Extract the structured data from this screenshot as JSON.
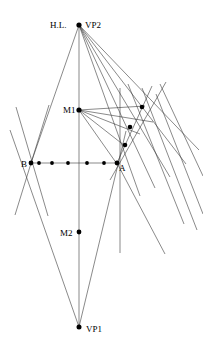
{
  "diagram": {
    "canvas": {
      "width": 203,
      "height": 349,
      "background": "#ffffff"
    },
    "stroke_color": "#3b3b3b",
    "dot_color": "#000000",
    "labels": {
      "horizon": "H.L.",
      "vp2": "VP2",
      "vp1": "VP1",
      "m1": "M1",
      "m2": "M2",
      "point_a": "A",
      "point_b": "B"
    },
    "vertices": [
      {
        "id": "vp2",
        "label": "VP2",
        "x": 79,
        "y": 25,
        "label_x": 84,
        "label_y": 24
      },
      {
        "id": "hl",
        "label": "H.L.",
        "x": 79,
        "y": 25,
        "label_x": 51,
        "label_y": 24
      },
      {
        "id": "m1",
        "label": "M1",
        "x": 79,
        "y": 110,
        "label_x": 62,
        "label_y": 113
      },
      {
        "id": "b",
        "label": "B",
        "x": 31,
        "y": 163,
        "label_x": 22,
        "label_y": 166
      },
      {
        "id": "a",
        "label": "A",
        "x": 117,
        "y": 163,
        "label_x": 120,
        "label_y": 170
      },
      {
        "id": "m2",
        "label": "M2",
        "x": 79,
        "y": 232,
        "label_x": 60,
        "label_y": 235
      },
      {
        "id": "vp1",
        "label": "VP1",
        "x": 79,
        "y": 327,
        "label_x": 85,
        "label_y": 331
      }
    ],
    "baseline_points": [
      {
        "x": 31,
        "y": 163,
        "r": 2.3
      },
      {
        "x": 39,
        "y": 163,
        "r": 1.9
      },
      {
        "x": 52,
        "y": 163,
        "r": 1.9
      },
      {
        "x": 68,
        "y": 163,
        "r": 1.9
      },
      {
        "x": 87,
        "y": 163,
        "r": 1.9
      },
      {
        "x": 104,
        "y": 163,
        "r": 1.9
      },
      {
        "x": 117,
        "y": 163,
        "r": 2.3
      }
    ],
    "right_chain_points": [
      {
        "x": 142,
        "y": 107,
        "r": 2.2
      },
      {
        "x": 130,
        "y": 127,
        "r": 2.2
      },
      {
        "x": 125,
        "y": 145,
        "r": 2.2
      }
    ],
    "segments": {
      "baseline": {
        "x1": 31,
        "y1": 163,
        "x2": 117,
        "y2": 163
      },
      "central_axis": {
        "x1": 79,
        "y1": 25,
        "x2": 79,
        "y2": 327
      },
      "vertical_right": {
        "x1": 120,
        "y1": 88,
        "x2": 120,
        "y2": 253
      },
      "vp2_to_b": {
        "x1": 79,
        "y1": 25,
        "x2": 31,
        "y2": 163
      },
      "vp2_to_a_ext": {
        "x1": 79,
        "y1": 25,
        "x2": 138,
        "y2": 193
      },
      "vp1_to_b_ext": {
        "x1": 79,
        "y1": 327,
        "x2": 10,
        "y2": 130
      },
      "vp1_to_a": {
        "x1": 79,
        "y1": 327,
        "x2": 117,
        "y2": 163
      },
      "b_cross_down": {
        "x1": 16,
        "y1": 107,
        "x2": 47,
        "y2": 213
      },
      "b_cross_up": {
        "x1": 16,
        "y1": 213,
        "x2": 47,
        "y2": 107
      }
    },
    "vp2_rays": [
      {
        "x2": 138,
        "y2": 193
      },
      {
        "x2": 152,
        "y2": 186
      },
      {
        "x2": 168,
        "y2": 176
      },
      {
        "x2": 183,
        "y2": 162
      },
      {
        "x2": 196,
        "y2": 148
      }
    ],
    "m1_rays": [
      {
        "x2": 142,
        "y2": 107
      },
      {
        "x2": 130,
        "y2": 127
      },
      {
        "x2": 125,
        "y2": 145
      },
      {
        "x2": 117,
        "y2": 163
      },
      {
        "x2": 152,
        "y2": 121
      }
    ],
    "right_diagonals": [
      {
        "x1": 130,
        "y1": 85,
        "x2": 182,
        "y2": 220
      },
      {
        "x1": 144,
        "y1": 91,
        "x2": 196,
        "y2": 228
      },
      {
        "x1": 158,
        "y1": 98,
        "x2": 202,
        "y2": 212
      },
      {
        "x1": 117,
        "y1": 163,
        "x2": 163,
        "y2": 252
      },
      {
        "x1": 152,
        "y1": 84,
        "x2": 200,
        "y2": 178
      }
    ],
    "a_fan_lines": [
      {
        "x1": 117,
        "y1": 163,
        "x2": 150,
        "y2": 90
      },
      {
        "x1": 117,
        "y1": 163,
        "x2": 163,
        "y2": 86
      }
    ]
  }
}
